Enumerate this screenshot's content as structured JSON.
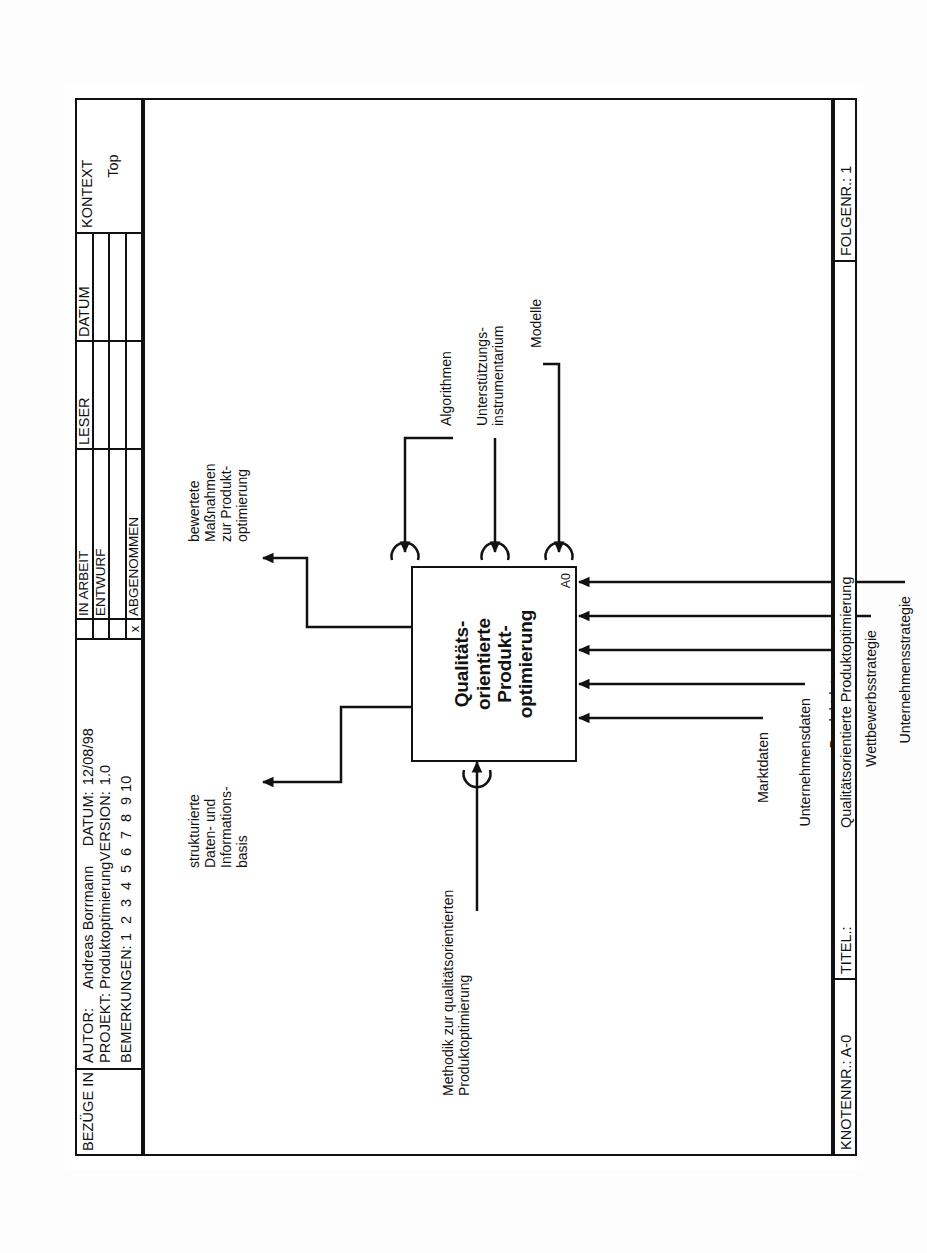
{
  "form": {
    "header": {
      "bezuege_label": "BEZÜGE IN",
      "autor_key": "AUTOR:",
      "autor_value": "Andreas Borrmann",
      "projekt_key": "PROJEKT:",
      "projekt_value": "Produktoptimierung",
      "datum_key": "DATUM:",
      "datum_value": "12/08/98",
      "version_key": "VERSION:",
      "version_value": "1.0",
      "bemerkungen_label": "BEMERKUNGEN:",
      "bemerkungen_numbers": [
        "1",
        "2",
        "3",
        "4",
        "5",
        "6",
        "7",
        "8",
        "9",
        "10"
      ],
      "status_rows": [
        {
          "mark": "",
          "label": "IN ARBEIT"
        },
        {
          "mark": "",
          "label": "ENTWURF"
        },
        {
          "mark": "",
          "label": ""
        },
        {
          "mark": "x",
          "label": "ABGENOMMEN"
        }
      ],
      "leser_label": "LESER",
      "datum_col_label": "DATUM",
      "kontext_label": "KONTEXT",
      "kontext_value": "Top"
    },
    "footer": {
      "knoten_key": "KNOTENNR.:",
      "knoten_value": "A-0",
      "titel_key": "TITEL.:",
      "titel_value": "Qualitätsorientierte Produktoptimierung",
      "folge_key": "FOLGENR.:",
      "folge_value": "1"
    }
  },
  "diagram": {
    "activity": {
      "title_lines": [
        "Qualitäts-",
        "orientierte",
        "Produkt-",
        "optimierung"
      ],
      "number": "A0"
    },
    "control": {
      "label_lines": [
        "Methodik zur qualitätsorientierten",
        "Produktoptimierung"
      ]
    },
    "inputs": [
      {
        "label": "Marktdaten"
      },
      {
        "label": "Unternehmensdaten"
      },
      {
        "label": "Produktdaten"
      },
      {
        "label": "Wettbewerbsstrategie"
      },
      {
        "label": "Unternehmensstrategie"
      }
    ],
    "outputs": [
      {
        "label_lines": [
          "strukturierte",
          "Daten- und",
          "Informations-",
          "basis"
        ]
      },
      {
        "label_lines": [
          "bewertete",
          "Maßnahmen",
          "zur Produkt-",
          "optimierung"
        ]
      }
    ],
    "mechanisms": [
      {
        "label_lines": [
          "Algorithmen"
        ]
      },
      {
        "label_lines": [
          "Unterstützungs-",
          "instrumentarium"
        ]
      },
      {
        "label_lines": [
          "Modelle"
        ]
      }
    ]
  }
}
